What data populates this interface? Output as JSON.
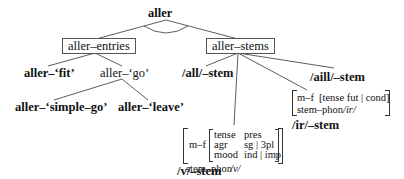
{
  "root": {
    "label": "aller"
  },
  "level1": {
    "entries": {
      "label": "aller–entries"
    },
    "stems": {
      "label": "aller–stems"
    }
  },
  "entries_children": {
    "fit": {
      "label": "aller–‘fit’"
    },
    "go": {
      "label": "aller–‘go’"
    }
  },
  "go_children": {
    "simple_go": {
      "label": "aller–‘simple–go’"
    },
    "leave": {
      "label": "aller–‘leave’"
    }
  },
  "stems_children": {
    "all": {
      "label": "/all/–stem"
    },
    "aill": {
      "label": "/aill/–stem"
    },
    "v": {
      "label": "/v/–stem",
      "avm": {
        "mf_attr": "m–f",
        "inner": [
          {
            "attr": "tense",
            "value": "pres"
          },
          {
            "attr": "agr",
            "value": "sg | 3pl"
          },
          {
            "attr": "mood",
            "value": "ind | imp"
          }
        ],
        "phon_attr": "stem–phon",
        "phon_value": "/v/"
      }
    },
    "ir": {
      "label": "/ir/–stem",
      "avm": {
        "mf_attr": "m–f",
        "mf_value": "[tense fut | cond]",
        "phon_attr": "stem–phon",
        "phon_value": "/ir/"
      }
    }
  }
}
